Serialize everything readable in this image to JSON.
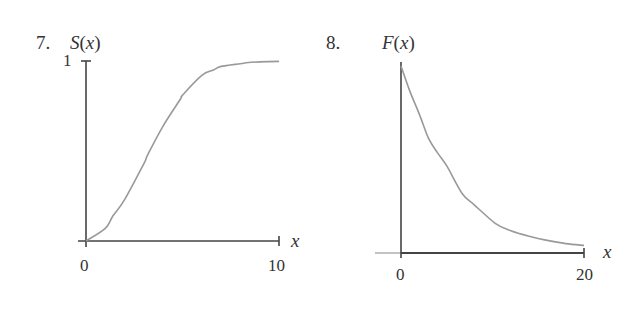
{
  "chart_data": [
    {
      "type": "line",
      "problem_number": "7.",
      "title": "",
      "ylabel": "S(x)",
      "xlabel": "x",
      "x_ticks": [
        "0",
        "10"
      ],
      "y_ticks": [
        "1"
      ],
      "xlim": [
        0,
        10
      ],
      "ylim": [
        0,
        1
      ],
      "grid": false,
      "legend": null,
      "shape": "sigmoid (S-shaped), increasing from 0 to approach 1",
      "x": [
        0,
        1,
        1.4,
        2,
        3,
        3.2,
        4,
        4.9,
        5,
        6,
        6.6,
        7,
        8,
        8.3,
        9,
        10
      ],
      "y": [
        0.0,
        0.07,
        0.14,
        0.23,
        0.43,
        0.48,
        0.64,
        0.79,
        0.81,
        0.92,
        0.95,
        0.97,
        0.985,
        0.99,
        0.995,
        0.998
      ]
    },
    {
      "type": "line",
      "problem_number": "8.",
      "title": "",
      "ylabel": "F(x)",
      "xlabel": "x",
      "x_ticks": [
        "0",
        "20"
      ],
      "y_ticks": [],
      "xlim": [
        0,
        20
      ],
      "ylim": [
        0,
        1
      ],
      "grid": false,
      "legend": null,
      "shape": "exponential decay from maximum at x=0 toward 0",
      "x": [
        0,
        1,
        2,
        3,
        4,
        5,
        6.7,
        8,
        10.3,
        12,
        14,
        15.7,
        18,
        20
      ],
      "y": [
        1.0,
        0.86,
        0.74,
        0.61,
        0.53,
        0.46,
        0.31,
        0.25,
        0.15,
        0.11,
        0.08,
        0.06,
        0.04,
        0.03
      ]
    }
  ],
  "figure": {
    "left": {
      "number": "7.",
      "ylabel_fn": "S",
      "ylabel_arg": "(x)",
      "ytick": "1",
      "xtick_start": "0",
      "xtick_end": "10",
      "xlabel": "x"
    },
    "right": {
      "number": "8.",
      "ylabel_fn": "F",
      "ylabel_arg": "(x)",
      "xtick_start": "0",
      "xtick_end": "20",
      "xlabel": "x"
    }
  },
  "colors": {
    "axis": "#444444",
    "curve": "#999999",
    "text": "#333333"
  }
}
